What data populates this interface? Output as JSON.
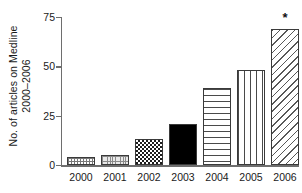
{
  "chart_data": {
    "type": "bar",
    "title": "",
    "subtitle": "",
    "xlabel": "",
    "ylabel": "No. of articles on Medline 2000–2006",
    "ylabel_line1": "No. of articles on Medline",
    "ylabel_line2": "2000–2006",
    "categories": [
      "2000",
      "2001",
      "2002",
      "2003",
      "2004",
      "2005",
      "2006"
    ],
    "values": [
      4,
      5,
      13,
      21,
      39,
      48,
      69
    ],
    "ylim": [
      0,
      75
    ],
    "yticks": [
      0,
      25,
      50,
      75
    ],
    "ytick_labels": [
      "0",
      "25",
      "50",
      "75"
    ],
    "grid": false,
    "legend": "none",
    "bar_patterns": [
      "dot-grid",
      "fine-grid",
      "checkerboard",
      "solid-black",
      "horizontal-lines",
      "vertical-lines",
      "diagonal-lines"
    ],
    "annotations": [
      {
        "text": "*",
        "category": "2006",
        "value": 69,
        "position": "above-bar"
      }
    ],
    "colors": {
      "axis": "#6e6e6e",
      "bar_outline": "#3a3a3a",
      "text": "#1a1a1a",
      "background": "#ffffff",
      "solid_bar": "#000000"
    }
  }
}
